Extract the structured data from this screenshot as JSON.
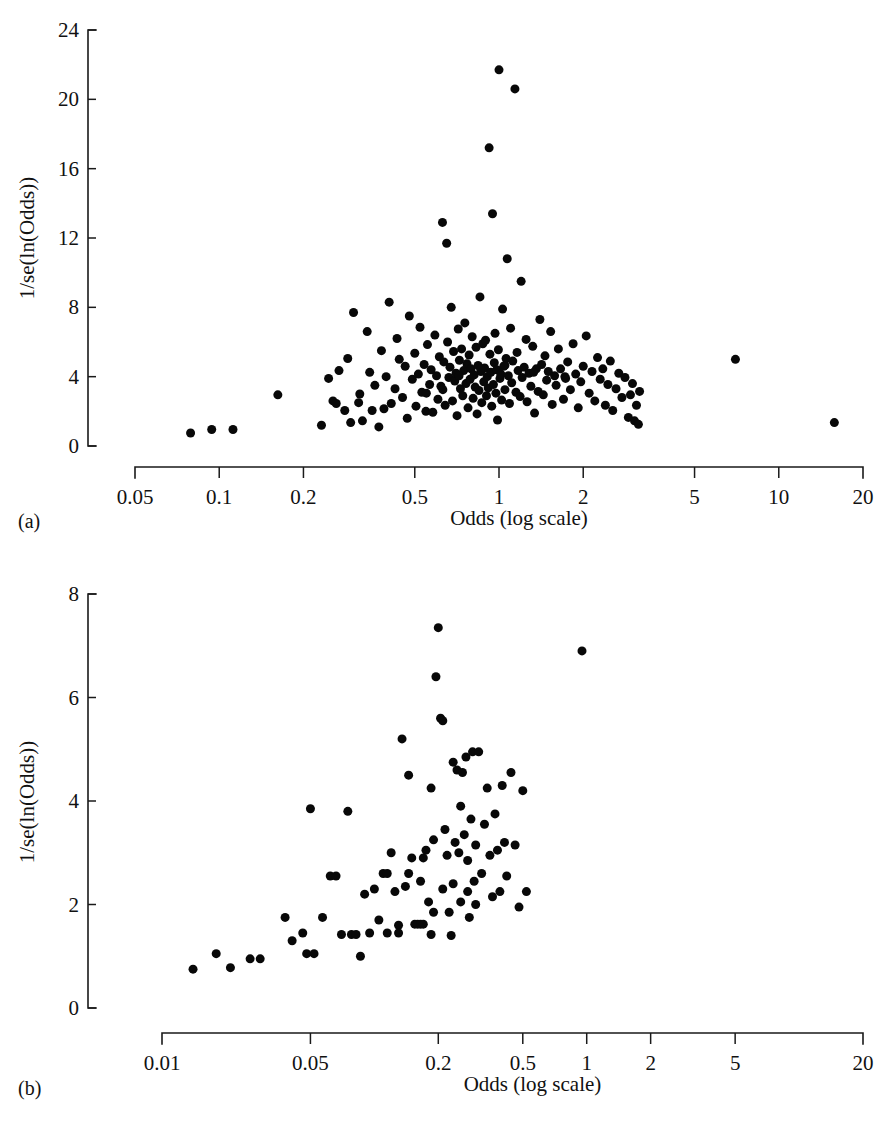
{
  "figure": {
    "panels": [
      {
        "key": "a",
        "label": "(a)"
      },
      {
        "key": "b",
        "label": "(b)"
      }
    ]
  },
  "chart_data": [
    {
      "panel": "(a)",
      "type": "scatter",
      "title": "",
      "xlabel": "Odds (log scale)",
      "ylabel": "1/se(ln(Odds))",
      "xscale": "log",
      "xlim": [
        0.05,
        20
      ],
      "ylim": [
        0,
        24
      ],
      "grid": false,
      "legend": "none",
      "xticks": [
        "0.05",
        "0.1",
        "0.2",
        "0.5",
        "1",
        "2",
        "5",
        "10",
        "20"
      ],
      "xtick_values": [
        0.05,
        0.1,
        0.2,
        0.5,
        1,
        2,
        5,
        10,
        20
      ],
      "yticks": [
        "0",
        "4",
        "8",
        "12",
        "16",
        "20",
        "24"
      ],
      "ytick_values": [
        0,
        4,
        8,
        12,
        16,
        20,
        24
      ],
      "marker": "filled-circle",
      "marker_color": "#080808",
      "marker_size_px": 9,
      "n_points": 186,
      "points": [
        [
          0.079,
          0.75
        ],
        [
          0.094,
          0.95
        ],
        [
          0.112,
          0.95
        ],
        [
          0.162,
          2.95
        ],
        [
          0.232,
          1.2
        ],
        [
          0.246,
          3.9
        ],
        [
          0.255,
          2.6
        ],
        [
          0.262,
          2.45
        ],
        [
          0.268,
          4.35
        ],
        [
          0.281,
          2.05
        ],
        [
          0.288,
          5.05
        ],
        [
          0.295,
          1.35
        ],
        [
          0.302,
          7.7
        ],
        [
          0.315,
          2.5
        ],
        [
          0.318,
          3.0
        ],
        [
          0.325,
          1.45
        ],
        [
          0.338,
          6.6
        ],
        [
          0.345,
          4.25
        ],
        [
          0.352,
          2.05
        ],
        [
          0.36,
          3.5
        ],
        [
          0.372,
          1.1
        ],
        [
          0.38,
          5.5
        ],
        [
          0.388,
          2.15
        ],
        [
          0.395,
          4.0
        ],
        [
          0.405,
          8.3
        ],
        [
          0.412,
          2.45
        ],
        [
          0.425,
          3.3
        ],
        [
          0.432,
          6.2
        ],
        [
          0.44,
          5.0
        ],
        [
          0.452,
          2.8
        ],
        [
          0.462,
          4.6
        ],
        [
          0.47,
          1.6
        ],
        [
          0.478,
          7.5
        ],
        [
          0.49,
          3.85
        ],
        [
          0.5,
          5.35
        ],
        [
          0.505,
          2.3
        ],
        [
          0.515,
          4.15
        ],
        [
          0.522,
          6.85
        ],
        [
          0.53,
          3.1
        ],
        [
          0.54,
          4.7
        ],
        [
          0.548,
          2.0
        ],
        [
          0.555,
          5.85
        ],
        [
          0.565,
          3.55
        ],
        [
          0.572,
          4.4
        ],
        [
          0.58,
          1.95
        ],
        [
          0.59,
          6.4
        ],
        [
          0.598,
          4.05
        ],
        [
          0.605,
          2.7
        ],
        [
          0.612,
          5.15
        ],
        [
          0.62,
          3.45
        ],
        [
          0.628,
          12.9
        ],
        [
          0.635,
          4.85
        ],
        [
          0.642,
          2.35
        ],
        [
          0.65,
          11.7
        ],
        [
          0.655,
          6.0
        ],
        [
          0.662,
          3.95
        ],
        [
          0.668,
          4.55
        ],
        [
          0.675,
          8.0
        ],
        [
          0.682,
          2.6
        ],
        [
          0.688,
          5.45
        ],
        [
          0.695,
          3.75
        ],
        [
          0.702,
          4.2
        ],
        [
          0.708,
          1.75
        ],
        [
          0.715,
          6.75
        ],
        [
          0.722,
          4.95
        ],
        [
          0.728,
          3.3
        ],
        [
          0.735,
          5.6
        ],
        [
          0.742,
          2.9
        ],
        [
          0.748,
          4.35
        ],
        [
          0.755,
          7.1
        ],
        [
          0.762,
          3.6
        ],
        [
          0.768,
          4.75
        ],
        [
          0.775,
          2.2
        ],
        [
          0.782,
          5.25
        ],
        [
          0.788,
          3.85
        ],
        [
          0.795,
          4.45
        ],
        [
          0.802,
          6.3
        ],
        [
          0.808,
          2.75
        ],
        [
          0.815,
          4.1
        ],
        [
          0.822,
          3.4
        ],
        [
          0.828,
          5.7
        ],
        [
          0.835,
          1.85
        ],
        [
          0.842,
          4.65
        ],
        [
          0.848,
          3.2
        ],
        [
          0.855,
          8.6
        ],
        [
          0.862,
          4.3
        ],
        [
          0.868,
          2.5
        ],
        [
          0.875,
          5.9
        ],
        [
          0.882,
          3.7
        ],
        [
          0.888,
          4.5
        ],
        [
          0.895,
          6.1
        ],
        [
          0.902,
          2.9
        ],
        [
          0.908,
          4.0
        ],
        [
          0.915,
          3.35
        ],
        [
          0.922,
          17.2
        ],
        [
          0.928,
          5.3
        ],
        [
          0.935,
          4.25
        ],
        [
          0.942,
          2.3
        ],
        [
          0.948,
          13.4
        ],
        [
          0.955,
          3.55
        ],
        [
          0.962,
          4.8
        ],
        [
          0.968,
          6.5
        ],
        [
          0.975,
          3.05
        ],
        [
          0.982,
          4.4
        ],
        [
          0.988,
          1.5
        ],
        [
          0.995,
          5.55
        ],
        [
          1.0,
          21.7
        ],
        [
          1.008,
          3.9
        ],
        [
          1.015,
          4.15
        ],
        [
          1.022,
          2.65
        ],
        [
          1.03,
          7.9
        ],
        [
          1.04,
          4.6
        ],
        [
          1.05,
          3.25
        ],
        [
          1.06,
          5.05
        ],
        [
          1.07,
          10.8
        ],
        [
          1.08,
          4.05
        ],
        [
          1.09,
          2.45
        ],
        [
          1.1,
          6.8
        ],
        [
          1.11,
          3.65
        ],
        [
          1.12,
          4.9
        ],
        [
          1.14,
          20.6
        ],
        [
          1.15,
          3.1
        ],
        [
          1.16,
          5.4
        ],
        [
          1.17,
          4.35
        ],
        [
          1.19,
          2.85
        ],
        [
          1.2,
          9.5
        ],
        [
          1.21,
          3.95
        ],
        [
          1.23,
          4.55
        ],
        [
          1.25,
          6.15
        ],
        [
          1.26,
          2.55
        ],
        [
          1.28,
          4.2
        ],
        [
          1.3,
          3.45
        ],
        [
          1.32,
          5.75
        ],
        [
          1.34,
          1.9
        ],
        [
          1.36,
          4.45
        ],
        [
          1.38,
          3.15
        ],
        [
          1.4,
          7.3
        ],
        [
          1.42,
          4.7
        ],
        [
          1.44,
          2.95
        ],
        [
          1.46,
          5.2
        ],
        [
          1.48,
          3.8
        ],
        [
          1.5,
          4.3
        ],
        [
          1.53,
          6.6
        ],
        [
          1.55,
          2.4
        ],
        [
          1.58,
          4.05
        ],
        [
          1.6,
          3.5
        ],
        [
          1.63,
          5.6
        ],
        [
          1.66,
          4.45
        ],
        [
          1.7,
          2.7
        ],
        [
          1.73,
          3.9
        ],
        [
          1.76,
          4.85
        ],
        [
          1.8,
          3.25
        ],
        [
          1.84,
          5.9
        ],
        [
          1.88,
          4.15
        ],
        [
          1.92,
          2.2
        ],
        [
          1.96,
          3.7
        ],
        [
          2.0,
          4.6
        ],
        [
          2.05,
          6.35
        ],
        [
          2.1,
          3.05
        ],
        [
          2.15,
          4.3
        ],
        [
          2.2,
          2.6
        ],
        [
          2.25,
          5.1
        ],
        [
          2.3,
          3.85
        ],
        [
          2.35,
          4.45
        ],
        [
          2.4,
          2.35
        ],
        [
          2.45,
          3.55
        ],
        [
          2.5,
          4.9
        ],
        [
          2.55,
          2.05
        ],
        [
          2.62,
          3.3
        ],
        [
          2.68,
          4.2
        ],
        [
          2.75,
          2.8
        ],
        [
          2.82,
          3.95
        ],
        [
          2.9,
          1.65
        ],
        [
          2.95,
          2.95
        ],
        [
          3.0,
          3.6
        ],
        [
          3.05,
          1.45
        ],
        [
          3.1,
          2.35
        ],
        [
          3.15,
          1.25
        ],
        [
          3.18,
          3.15
        ],
        [
          7.0,
          5.0
        ],
        [
          15.8,
          1.35
        ],
        [
          0.72,
          4.05
        ],
        [
          0.86,
          4.45
        ],
        [
          1.05,
          4.65
        ],
        [
          1.33,
          4.25
        ],
        [
          0.63,
          3.25
        ],
        [
          1.72,
          4.0
        ],
        [
          0.55,
          3.05
        ]
      ]
    },
    {
      "panel": "(b)",
      "type": "scatter",
      "title": "",
      "xlabel": "Odds (log scale)",
      "ylabel": "1/se(ln(Odds))",
      "xscale": "log",
      "xlim": [
        0.01,
        20
      ],
      "ylim": [
        0,
        8
      ],
      "grid": false,
      "legend": "none",
      "xticks": [
        "0.01",
        "0.05",
        "0.2",
        "0.5",
        "1",
        "2",
        "5",
        "20"
      ],
      "xtick_values": [
        0.01,
        0.05,
        0.2,
        0.5,
        1,
        2,
        5,
        20
      ],
      "yticks": [
        "0",
        "2",
        "4",
        "6",
        "8"
      ],
      "ytick_values": [
        0,
        2,
        4,
        6,
        8
      ],
      "marker": "filled-circle",
      "marker_color": "#080808",
      "marker_size_px": 9,
      "n_points": 92,
      "points": [
        [
          0.014,
          0.75
        ],
        [
          0.018,
          1.05
        ],
        [
          0.021,
          0.78
        ],
        [
          0.026,
          0.95
        ],
        [
          0.029,
          0.95
        ],
        [
          0.038,
          1.75
        ],
        [
          0.041,
          1.3
        ],
        [
          0.046,
          1.45
        ],
        [
          0.048,
          1.05
        ],
        [
          0.05,
          3.85
        ],
        [
          0.052,
          1.05
        ],
        [
          0.057,
          1.75
        ],
        [
          0.062,
          2.55
        ],
        [
          0.066,
          2.55
        ],
        [
          0.07,
          1.42
        ],
        [
          0.075,
          3.8
        ],
        [
          0.078,
          1.42
        ],
        [
          0.082,
          1.42
        ],
        [
          0.086,
          1.0
        ],
        [
          0.09,
          2.2
        ],
        [
          0.095,
          1.45
        ],
        [
          0.1,
          2.3
        ],
        [
          0.105,
          1.7
        ],
        [
          0.11,
          2.6
        ],
        [
          0.115,
          1.45
        ],
        [
          0.12,
          3.0
        ],
        [
          0.125,
          2.25
        ],
        [
          0.13,
          1.6
        ],
        [
          0.135,
          5.2
        ],
        [
          0.14,
          2.35
        ],
        [
          0.145,
          4.5
        ],
        [
          0.15,
          2.9
        ],
        [
          0.155,
          1.62
        ],
        [
          0.16,
          1.62
        ],
        [
          0.165,
          1.62
        ],
        [
          0.17,
          1.62
        ],
        [
          0.175,
          3.05
        ],
        [
          0.18,
          2.05
        ],
        [
          0.185,
          4.25
        ],
        [
          0.19,
          3.25
        ],
        [
          0.195,
          6.4
        ],
        [
          0.2,
          7.35
        ],
        [
          0.205,
          5.6
        ],
        [
          0.21,
          5.55
        ],
        [
          0.215,
          3.45
        ],
        [
          0.22,
          2.95
        ],
        [
          0.225,
          1.85
        ],
        [
          0.23,
          1.4
        ],
        [
          0.235,
          2.4
        ],
        [
          0.24,
          3.2
        ],
        [
          0.245,
          4.6
        ],
        [
          0.25,
          3.0
        ],
        [
          0.255,
          2.05
        ],
        [
          0.26,
          4.55
        ],
        [
          0.265,
          3.35
        ],
        [
          0.27,
          4.85
        ],
        [
          0.275,
          2.85
        ],
        [
          0.28,
          1.75
        ],
        [
          0.285,
          3.65
        ],
        [
          0.29,
          4.95
        ],
        [
          0.295,
          2.45
        ],
        [
          0.3,
          3.15
        ],
        [
          0.31,
          4.95
        ],
        [
          0.32,
          2.6
        ],
        [
          0.33,
          3.55
        ],
        [
          0.34,
          4.25
        ],
        [
          0.35,
          2.95
        ],
        [
          0.36,
          2.15
        ],
        [
          0.37,
          3.75
        ],
        [
          0.38,
          3.05
        ],
        [
          0.39,
          2.25
        ],
        [
          0.4,
          4.3
        ],
        [
          0.41,
          3.2
        ],
        [
          0.42,
          2.55
        ],
        [
          0.44,
          4.55
        ],
        [
          0.46,
          3.15
        ],
        [
          0.48,
          1.95
        ],
        [
          0.5,
          4.2
        ],
        [
          0.52,
          2.25
        ],
        [
          0.95,
          6.9
        ],
        [
          0.115,
          2.6
        ],
        [
          0.145,
          2.6
        ],
        [
          0.165,
          2.45
        ],
        [
          0.185,
          1.42
        ],
        [
          0.21,
          2.3
        ],
        [
          0.235,
          4.75
        ],
        [
          0.255,
          3.9
        ],
        [
          0.275,
          2.25
        ],
        [
          0.3,
          2.0
        ],
        [
          0.13,
          1.45
        ],
        [
          0.17,
          2.9
        ],
        [
          0.19,
          1.85
        ]
      ]
    }
  ]
}
